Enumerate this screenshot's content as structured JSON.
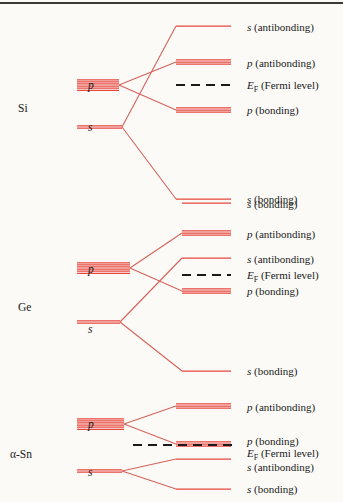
{
  "figure": {
    "background_color": "#fbfaf7",
    "level_color": "#e8453c",
    "connector_color": "#d4635c",
    "fermi_color": "#1a1a1a",
    "rule_color": "#3a3a38"
  },
  "chart_data": {
    "type": "diagram",
    "xlabel": "",
    "ylabel": "Energy",
    "grid": false,
    "legend": "none",
    "groups": [
      {
        "element": "Si",
        "element_label_x": 18,
        "element_label_y": 103,
        "atomic_levels": [
          {
            "orbital": "p",
            "label": "p",
            "label_x": 88,
            "label_y": 80,
            "x1": 77,
            "x2": 119,
            "y": 85,
            "degeneracy": 6
          },
          {
            "orbital": "s",
            "label": "s",
            "label_x": 88,
            "label_y": 122,
            "x1": 77,
            "x2": 122,
            "y": 127,
            "degeneracy": 2
          }
        ],
        "split_levels": [
          {
            "name": "s-antibonding",
            "label": "s (antibonding)",
            "label_italic": "s",
            "label_rest": " (antibonding)",
            "x1": 176,
            "x2": 231,
            "y": 26,
            "degeneracy": 1,
            "text_x": 247,
            "text_y": 22,
            "from": "s"
          },
          {
            "name": "p-antibonding",
            "label": "p (antibonding)",
            "label_italic": "p",
            "label_rest": " (antibonding)",
            "x1": 176,
            "x2": 231,
            "y": 62,
            "degeneracy": 3,
            "text_x": 247,
            "text_y": 58,
            "from": "p"
          },
          {
            "name": "fermi",
            "label": "E_F (Fermi level)",
            "label_italic": "E",
            "label_sub": "F",
            "label_rest": " (Fermi level)",
            "x1": 176,
            "x2": 231,
            "y": 85,
            "dashed": true,
            "text_x": 247,
            "text_y": 80,
            "from": null
          },
          {
            "name": "p-bonding",
            "label": "p (bonding)",
            "label_italic": "p",
            "label_rest": " (bonding)",
            "x1": 176,
            "x2": 231,
            "y": 110,
            "degeneracy": 3,
            "text_x": 247,
            "text_y": 105,
            "from": "p"
          },
          {
            "name": "s-bonding",
            "label": "s (bonding)",
            "label_italic": "s",
            "label_rest": " (bonding)",
            "x1": 176,
            "x2": 231,
            "y": 199,
            "degeneracy": 1,
            "text_x": 247,
            "text_y": 194,
            "from": "s"
          }
        ],
        "connectors": [
          {
            "x1": 119,
            "y1": 85,
            "x2": 176,
            "y2": 62
          },
          {
            "x1": 119,
            "y1": 85,
            "x2": 176,
            "y2": 110
          },
          {
            "x1": 122,
            "y1": 127,
            "x2": 176,
            "y2": 26
          },
          {
            "x1": 122,
            "y1": 127,
            "x2": 176,
            "y2": 199
          }
        ]
      },
      {
        "element": "Ge",
        "element_label_x": 18,
        "element_label_y": 302,
        "atomic_levels": [
          {
            "orbital": "p",
            "label": "p",
            "label_x": 88,
            "label_y": 264,
            "x1": 77,
            "x2": 130,
            "y": 268,
            "degeneracy": 6
          },
          {
            "orbital": "s",
            "label": "s",
            "label_x": 88,
            "label_y": 324,
            "x1": 77,
            "x2": 120,
            "y": 322,
            "degeneracy": 2
          }
        ],
        "split_levels": [
          {
            "name": "s-bonding-upper",
            "label": "s (bonding)",
            "label_italic": "s",
            "label_rest": " (bonding)",
            "x1": 182,
            "x2": 231,
            "y": 203,
            "degeneracy": 1,
            "text_x": 247,
            "text_y": 199,
            "from": "prev-s"
          },
          {
            "name": "p-antibonding",
            "label": "p (antibonding)",
            "label_italic": "p",
            "label_rest": " (antibonding)",
            "x1": 182,
            "x2": 231,
            "y": 233,
            "degeneracy": 3,
            "text_x": 247,
            "text_y": 229,
            "from": "p"
          },
          {
            "name": "s-antibonding",
            "label": "s (antibonding)",
            "label_italic": "s",
            "label_rest": " (antibonding)",
            "x1": 182,
            "x2": 231,
            "y": 258,
            "degeneracy": 1,
            "text_x": 247,
            "text_y": 254,
            "from": "s"
          },
          {
            "name": "fermi",
            "label": "E_F (Fermi level)",
            "label_italic": "E",
            "label_sub": "F",
            "label_rest": " (Fermi level)",
            "x1": 182,
            "x2": 231,
            "y": 275,
            "dashed": true,
            "text_x": 247,
            "text_y": 270,
            "from": null
          },
          {
            "name": "p-bonding",
            "label": "p (bonding)",
            "label_italic": "p",
            "label_rest": " (bonding)",
            "x1": 182,
            "x2": 231,
            "y": 291,
            "degeneracy": 3,
            "text_x": 247,
            "text_y": 286,
            "from": "p"
          },
          {
            "name": "s-bonding",
            "label": "s (bonding)",
            "label_italic": "s",
            "label_rest": " (bonding)",
            "x1": 182,
            "x2": 231,
            "y": 371,
            "degeneracy": 1,
            "text_x": 247,
            "text_y": 366,
            "from": "s"
          }
        ],
        "connectors": [
          {
            "x1": 130,
            "y1": 268,
            "x2": 182,
            "y2": 233
          },
          {
            "x1": 130,
            "y1": 268,
            "x2": 182,
            "y2": 291
          },
          {
            "x1": 120,
            "y1": 322,
            "x2": 182,
            "y2": 258
          },
          {
            "x1": 120,
            "y1": 322,
            "x2": 182,
            "y2": 371
          }
        ]
      },
      {
        "element": "α-Sn",
        "element_label_x": 10,
        "element_label_y": 449,
        "atomic_levels": [
          {
            "orbital": "p",
            "label": "p",
            "label_x": 88,
            "label_y": 419,
            "x1": 77,
            "x2": 124,
            "y": 424,
            "degeneracy": 6
          },
          {
            "orbital": "s",
            "label": "s",
            "label_x": 88,
            "label_y": 467,
            "x1": 77,
            "x2": 122,
            "y": 471,
            "degeneracy": 2
          }
        ],
        "split_levels": [
          {
            "name": "p-antibonding",
            "label": "p (antibonding)",
            "label_italic": "p",
            "label_rest": " (antibonding)",
            "x1": 176,
            "x2": 231,
            "y": 406,
            "degeneracy": 3,
            "text_x": 247,
            "text_y": 402,
            "from": "p"
          },
          {
            "name": "p-bonding",
            "label": "p (bonding)",
            "label_italic": "p",
            "label_rest": " (bonding)",
            "x1": 176,
            "x2": 231,
            "y": 444,
            "degeneracy": 3,
            "text_x": 247,
            "text_y": 436,
            "from": "p"
          },
          {
            "name": "fermi",
            "label": "E_F (Fermi level)",
            "label_italic": "E",
            "label_sub": "F",
            "label_rest": " (Fermi level)",
            "x1": 133,
            "x2": 234,
            "y": 445,
            "dashed": true,
            "text_x": 247,
            "text_y": 448,
            "from": null
          },
          {
            "name": "s-antibonding",
            "label": "s (antibonding)",
            "label_italic": "s",
            "label_rest": " (antibonding)",
            "x1": 176,
            "x2": 231,
            "y": 459,
            "degeneracy": 1,
            "text_x": 247,
            "text_y": 462,
            "from": "s"
          },
          {
            "name": "s-bonding",
            "label": "s (bonding)",
            "label_italic": "s",
            "label_rest": " (bonding)",
            "x1": 176,
            "x2": 231,
            "y": 489,
            "degeneracy": 1,
            "text_x": 247,
            "text_y": 484,
            "from": "s"
          }
        ],
        "connectors": [
          {
            "x1": 124,
            "y1": 424,
            "x2": 176,
            "y2": 406
          },
          {
            "x1": 124,
            "y1": 424,
            "x2": 176,
            "y2": 444
          },
          {
            "x1": 122,
            "y1": 471,
            "x2": 176,
            "y2": 459
          },
          {
            "x1": 122,
            "y1": 471,
            "x2": 176,
            "y2": 489
          }
        ]
      }
    ]
  }
}
